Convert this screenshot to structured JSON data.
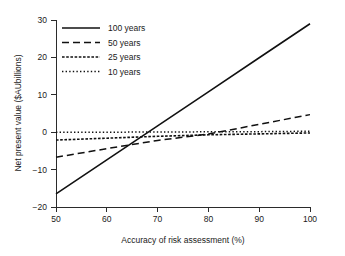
{
  "chart_data": {
    "type": "line",
    "title": "",
    "xlabel": "Accuracy of risk assessment (%)",
    "ylabel": "Net present value ($AUbillions)",
    "xlim": [
      50,
      100
    ],
    "ylim": [
      -20,
      30
    ],
    "xticks": [
      50,
      60,
      70,
      80,
      90,
      100
    ],
    "xticklabels": [
      "50",
      "60",
      "70",
      "80",
      "90",
      "100"
    ],
    "yticks": [
      -20,
      -10,
      0,
      10,
      20,
      30
    ],
    "yticklabels": [
      "-20",
      "-10",
      "0",
      "10",
      "20",
      "30"
    ],
    "grid": false,
    "legend_position": "upper-left",
    "x": [
      50,
      60,
      70,
      80,
      90,
      100
    ],
    "series": [
      {
        "name": "100 years",
        "label": "100 years",
        "style": "solid",
        "dasharray": "none",
        "width": 1.6,
        "color": "#111111",
        "values": [
          -16.5,
          -7.4,
          1.7,
          10.8,
          19.9,
          29.0
        ]
      },
      {
        "name": "50 years",
        "label": "50 years",
        "style": "dashed",
        "dasharray": "7,4",
        "width": 1.5,
        "color": "#111111",
        "values": [
          -6.7,
          -4.4,
          -2.2,
          -0.5,
          2.1,
          4.7
        ]
      },
      {
        "name": "25 years",
        "label": "25 years",
        "style": "fine-dashed",
        "dasharray": "2.6,1.6",
        "width": 1.6,
        "color": "#111111",
        "values": [
          -2.1,
          -1.6,
          -1.1,
          -0.7,
          -0.45,
          -0.2
        ]
      },
      {
        "name": "10 years",
        "label": "10 years",
        "style": "dotted",
        "dasharray": "1.4,2.2",
        "width": 1.5,
        "color": "#111111",
        "values": [
          0.0,
          0.0,
          0.05,
          0.1,
          0.15,
          0.25
        ]
      }
    ]
  },
  "legend": {
    "entries": [
      {
        "label": "100 years"
      },
      {
        "label": "50 years"
      },
      {
        "label": "25 years"
      },
      {
        "label": "10 years"
      }
    ]
  },
  "colors": {
    "ink": "#111111",
    "axis": "#2b2b2b",
    "background": "#ffffff"
  }
}
